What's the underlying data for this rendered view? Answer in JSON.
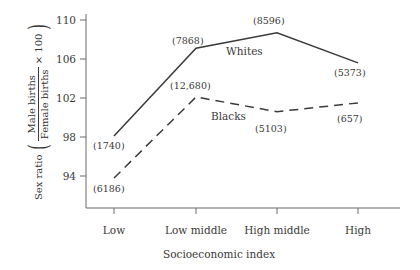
{
  "chart_data": {
    "type": "line",
    "title": "",
    "xlabel": "Socioeconomic index",
    "ylabel_prefix": "Sex ratio",
    "ylabel_numerator": "Male births",
    "ylabel_denominator": "Female births",
    "ylabel_multiplier": "× 100",
    "categories": [
      "Low",
      "Low middle",
      "High middle",
      "High"
    ],
    "ylim": [
      92.2,
      111.0
    ],
    "yticks": [
      94,
      98,
      102,
      106,
      110
    ],
    "grid": false,
    "legend_position": "inline-annotation",
    "series": [
      {
        "name": "Whites",
        "style": "solid",
        "values": [
          98.1,
          107.1,
          108.7,
          105.6
        ],
        "point_labels": [
          "(1740)",
          "(7868)",
          "(8596)",
          "(5373)"
        ]
      },
      {
        "name": "Blacks",
        "style": "dashed",
        "values": [
          93.8,
          102.1,
          100.6,
          101.5
        ],
        "point_labels": [
          "(6186)",
          "(12,680)",
          "(5103)",
          "(657)"
        ]
      }
    ]
  },
  "axes": {
    "y_tick_labels": [
      "110",
      "106",
      "102",
      "98",
      "94"
    ],
    "x_tick_labels": [
      "Low",
      "Low middle",
      "High middle",
      "High"
    ]
  },
  "annotations": {
    "whites_label": "Whites",
    "blacks_label": "Blacks",
    "whites_points": [
      "(1740)",
      "(7868)",
      "(8596)",
      "(5373)"
    ],
    "blacks_points": [
      "(6186)",
      "(12,680)",
      "(5103)",
      "(657)"
    ]
  },
  "colors": {
    "line": "#3a3a3a",
    "axis": "#6b6b6b",
    "text": "#3a3a3a",
    "background": "#ffffff"
  }
}
